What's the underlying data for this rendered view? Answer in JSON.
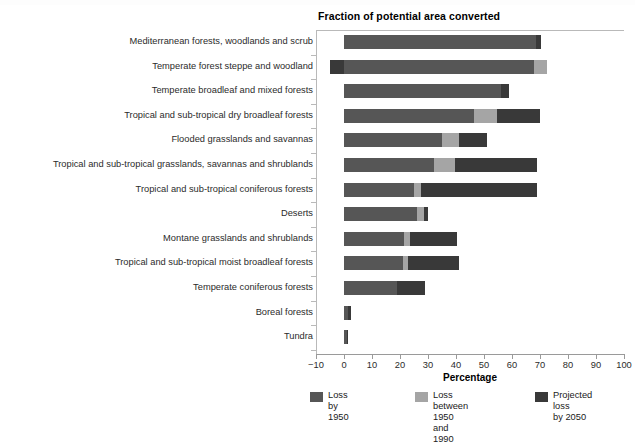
{
  "figure": {
    "title": "Fraction of potential area converted",
    "top_clipped_text": "",
    "axis_title": "Percentage"
  },
  "chart_data": {
    "type": "bar",
    "orientation": "horizontal",
    "stacked": true,
    "title": "Fraction of potential area converted",
    "xlabel": "Percentage",
    "ylabel": "",
    "xlim": [
      -10,
      100
    ],
    "xticks": [
      -10,
      0,
      10,
      20,
      30,
      40,
      50,
      60,
      70,
      80,
      90,
      100
    ],
    "xticklabels": [
      "−10",
      "0",
      "10",
      "20",
      "30",
      "40",
      "50",
      "60",
      "70",
      "80",
      "90",
      "100"
    ],
    "grid": false,
    "legend_position": "bottom",
    "categories": [
      "Mediterranean forests, woodlands and scrub",
      "Temperate forest steppe and woodland",
      "Temperate broadleaf and mixed forests",
      "Tropical and sub-tropical dry broadleaf forests",
      "Flooded grasslands and savannas",
      "Tropical and sub-tropical grasslands, savannas and shrublands",
      "Tropical and sub-tropical coniferous forests",
      "Deserts",
      "Montane grasslands and shrublands",
      "Tropical and sub-tropical moist broadleaf forests",
      "Temperate coniferous forests",
      "Boreal forests",
      "Tundra"
    ],
    "series": [
      {
        "name": "Loss by 1950",
        "color": "#565656",
        "values": [
          68.5,
          68.0,
          56.0,
          46.5,
          35.0,
          32.0,
          25.0,
          26.0,
          21.5,
          21.0,
          19.0,
          1.5,
          1.0
        ]
      },
      {
        "name": "Loss between 1950 and 1990",
        "color": "#a5a5a5",
        "values": [
          0.0,
          4.5,
          0.0,
          8.0,
          6.0,
          7.5,
          2.5,
          2.5,
          2.0,
          2.0,
          0.0,
          0.0,
          0.0
        ]
      },
      {
        "name": "Projected loss by 2050",
        "color": "#393939",
        "values": [
          2.0,
          0.0,
          3.0,
          15.5,
          10.0,
          29.5,
          41.5,
          1.5,
          17.0,
          18.0,
          10.0,
          1.0,
          0.5
        ]
      }
    ],
    "negative_offsets": [
      0,
      -5,
      0,
      0,
      0,
      0,
      0,
      0,
      0,
      0,
      0,
      0,
      0
    ]
  },
  "legend": {
    "items": [
      {
        "label": "Loss by\n1950",
        "swatch": "s1"
      },
      {
        "label": "Loss between\n1950 and 1990",
        "swatch": "s2"
      },
      {
        "label": "Projected loss\nby 2050",
        "swatch": "s3"
      }
    ]
  }
}
